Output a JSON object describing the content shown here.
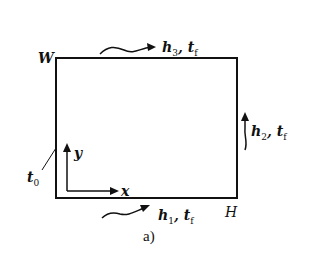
{
  "figure": {
    "caption": "a)",
    "corners": {
      "top_left": "W",
      "bottom_right": "H"
    },
    "boundaries": {
      "top": {
        "h": "h",
        "h_sub": "3",
        "t": "t",
        "t_sub": "f"
      },
      "right": {
        "h": "h",
        "h_sub": "2",
        "t": "t",
        "t_sub": "f"
      },
      "bottom": {
        "h": "h",
        "h_sub": "1",
        "t": "t",
        "t_sub": "f"
      },
      "left": {
        "t": "t",
        "t_sub": "0"
      }
    },
    "axes": {
      "x": "x",
      "y": "y"
    },
    "separator": ","
  }
}
